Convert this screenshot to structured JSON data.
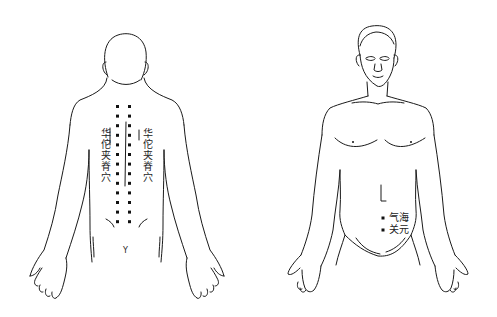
{
  "figures": {
    "back": {
      "title": "back-view",
      "left_label": "华佗夹脊穴",
      "right_label": "华佗夹脊穴",
      "sacrum_mark": "Y",
      "spine_dot_rows": 13,
      "spine_dot_columns_x": [
        117,
        129
      ],
      "spine_dot_start_y": 106,
      "spine_dot_spacing": 9.6
    },
    "front": {
      "title": "front-view",
      "points": [
        {
          "name": "气海",
          "x": 383,
          "y": 218
        },
        {
          "name": "关元",
          "x": 383,
          "y": 230
        }
      ]
    }
  },
  "colors": {
    "line": "#1a1a1a",
    "text": "#222222",
    "background": "#ffffff"
  }
}
